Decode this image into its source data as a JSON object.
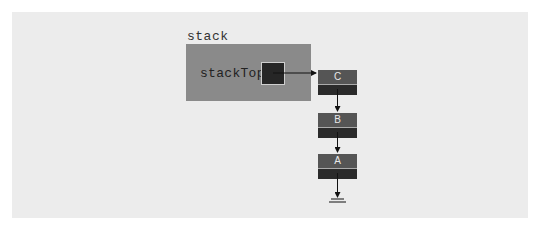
{
  "diagram": {
    "stack_label": "stack",
    "stack_top_label": "stackTop",
    "nodes": [
      {
        "value": "C"
      },
      {
        "value": "B"
      },
      {
        "value": "A"
      }
    ],
    "terminator": "null-ground",
    "colors": {
      "panel": "#ececec",
      "stack_box": "#8a8a8a",
      "pointer_cell": "#262626",
      "node_data": "#555555",
      "node_next": "#2a2a2a",
      "arrow": "#111111"
    }
  }
}
